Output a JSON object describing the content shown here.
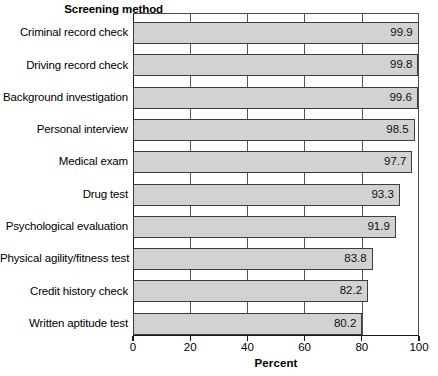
{
  "chart_data": {
    "type": "bar",
    "orientation": "horizontal",
    "title": "",
    "ylabel": "Screening method",
    "xlabel": "Percent",
    "xlim": [
      0,
      100
    ],
    "xticks": [
      0,
      20,
      40,
      60,
      80,
      100
    ],
    "xtick_labels": [
      "0",
      "20",
      "40",
      "60",
      "80",
      "100"
    ],
    "grid": "vertical",
    "legend": "none",
    "bar_fill_color": "#d2d2d2",
    "bar_border_color": "#3d3d3d",
    "categories": [
      "Criminal record check",
      "Driving record check",
      "Background investigation",
      "Personal interview",
      "Medical exam",
      "Drug test",
      "Psychological evaluation",
      "Physical agility/fitness test",
      "Credit history check",
      "Written aptitude test"
    ],
    "values": [
      99.9,
      99.8,
      99.6,
      98.5,
      97.7,
      93.3,
      91.9,
      83.8,
      82.2,
      80.2
    ],
    "value_labels": [
      "99.9",
      "99.8",
      "99.6",
      "98.5",
      "97.7",
      "93.3",
      "91.9",
      "83.8",
      "82.2",
      "80.2"
    ]
  }
}
